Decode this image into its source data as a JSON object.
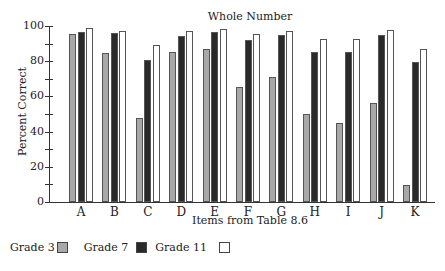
{
  "chart_data": {
    "type": "bar",
    "title": "Whole Number",
    "xlabel": "Items from Table 8.6",
    "ylabel": "Percent Correct",
    "ylim": [
      0,
      100
    ],
    "yticks": [
      0,
      20,
      40,
      60,
      80,
      100
    ],
    "grid": false,
    "legend_position": "bottom-left",
    "categories": [
      "A",
      "B",
      "C",
      "D",
      "E",
      "F",
      "G",
      "H",
      "I",
      "J",
      "K"
    ],
    "series": [
      {
        "name": "Grade 3",
        "color": "#a8a8a8",
        "values": [
          95.5,
          84.7,
          47.5,
          85.2,
          87.1,
          65.2,
          71.0,
          50.0,
          45.1,
          56.4,
          9.5
        ]
      },
      {
        "name": "Grade 7",
        "color": "#2a2a2a",
        "values": [
          96.6,
          95.8,
          80.9,
          94.3,
          96.4,
          92.2,
          94.7,
          85.4,
          85.4,
          94.9,
          79.7
        ]
      },
      {
        "name": "Grade 11",
        "color": "#ffffff",
        "values": [
          98.7,
          97.0,
          89.2,
          97.3,
          98.3,
          95.3,
          97.3,
          92.4,
          92.6,
          97.9,
          86.8
        ]
      }
    ]
  },
  "legend": [
    {
      "label": "Grade 3",
      "color": "#a8a8a8"
    },
    {
      "label": "Grade 7",
      "color": "#2a2a2a"
    },
    {
      "label": "Grade 11",
      "color": "#ffffff"
    }
  ]
}
